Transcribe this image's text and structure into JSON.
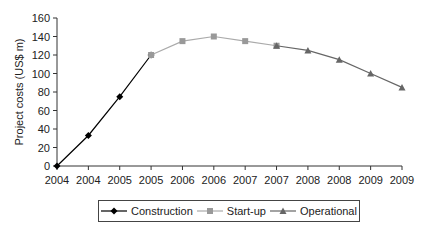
{
  "chart_data": {
    "type": "line",
    "title": "",
    "xlabel": "",
    "ylabel": "Project costs (US$ m)",
    "ylim": [
      0,
      160
    ],
    "yticks": [
      0,
      20,
      40,
      60,
      80,
      100,
      120,
      140,
      160
    ],
    "categories": [
      "2004",
      "2004",
      "2005",
      "2005",
      "2006",
      "2006",
      "2007",
      "2007",
      "2008",
      "2008",
      "2009",
      "2009"
    ],
    "grid": false,
    "legend_position": "bottom",
    "series": [
      {
        "name": "Construction",
        "marker": "diamond",
        "color": "#000000",
        "values": [
          0,
          33,
          75,
          120,
          null,
          null,
          null,
          null,
          null,
          null,
          null,
          null
        ]
      },
      {
        "name": "Start-up",
        "marker": "square",
        "color": "#999999",
        "values": [
          null,
          null,
          null,
          120,
          135,
          140,
          135,
          130,
          null,
          null,
          null,
          null
        ]
      },
      {
        "name": "Operational",
        "marker": "triangle",
        "color": "#666666",
        "values": [
          null,
          null,
          null,
          null,
          null,
          null,
          null,
          130,
          125,
          115,
          100,
          85
        ]
      }
    ]
  },
  "legend": {
    "construction": "Construction",
    "startup": "Start-up",
    "operational": "Operational"
  }
}
